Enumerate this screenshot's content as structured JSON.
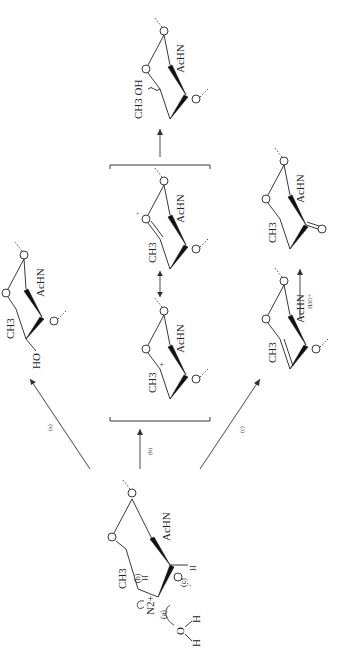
{
  "figure": {
    "orientation": "rotated-90-ccw",
    "background": "#ffffff",
    "ink": "#222222"
  },
  "start": {
    "ring_labels": {
      "ch3": "CH3",
      "achn": "AcHN",
      "o_ring": "O",
      "o_glyc_1": "O",
      "o_glyc_2": "O"
    },
    "leaving_group": "N2+",
    "mechanism_labels": [
      "(a)",
      "(b)",
      "(c)"
    ],
    "hydrogens": {
      "h_b": "H",
      "h_c": "H"
    },
    "water": {
      "o": "O",
      "h1": "H",
      "h2": "H"
    }
  },
  "paths": {
    "a": {
      "label": "(a)"
    },
    "b": {
      "label": "(b)"
    },
    "c": {
      "label": "(c)"
    }
  },
  "product_a": {
    "ch3": "CH3",
    "achn": "AcHN",
    "ho": "HO",
    "o_ring": "O",
    "o_glyc": "O"
  },
  "carbocation": {
    "ch3": "CH3",
    "achn": "AcHN",
    "charge": "+",
    "o_ring": "O",
    "o_glyc_1": "O",
    "o_glyc_2": "O"
  },
  "oxocarbenium": {
    "ch3": "CH3",
    "achn": "AcHN",
    "charge": "+",
    "o_ring": "O",
    "o_glyc": "O"
  },
  "product_b": {
    "ch3_oh": "CH3 OH",
    "achn": "AcHN",
    "o_ring": "O",
    "o_glyc_1": "O",
    "o_glyc_2": "O"
  },
  "enol_ether": {
    "ch3": "CH3",
    "achn": "AcHN",
    "o_ring": "O",
    "o_glyc_1": "O",
    "o_glyc_2": "O"
  },
  "hydrolysis": {
    "reagent": "H3O+"
  },
  "product_c": {
    "ch3": "CH3",
    "achn": "AcHN",
    "o_ring": "O",
    "carbonyl_o": "O",
    "o_glyc": "O"
  }
}
